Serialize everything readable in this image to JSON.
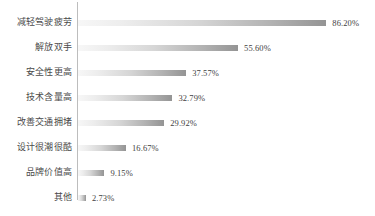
{
  "chart_data": {
    "type": "bar",
    "orientation": "horizontal",
    "title": "",
    "xlabel": "",
    "ylabel": "",
    "grid": false,
    "legend": false,
    "axis_line": true,
    "xlim": [
      0,
      100
    ],
    "value_suffix": "%",
    "categories": [
      "减轻驾驶疲劳",
      "解放双手",
      "安全性更高",
      "技术含量高",
      "改善交通拥堵",
      "设计很潮很酷",
      "品牌价值高",
      "其他"
    ],
    "values": [
      86.2,
      55.6,
      37.57,
      32.79,
      29.92,
      16.67,
      9.15,
      2.73
    ],
    "value_labels": [
      "86.20%",
      "55.60%",
      "37.57%",
      "32.79%",
      "29.92%",
      "16.67%",
      "9.15%",
      "2.73%"
    ],
    "bars": [
      {
        "category": "减轻驾驶疲劳",
        "value": 86.2,
        "label": "86.20%"
      },
      {
        "category": "解放双手",
        "value": 55.6,
        "label": "55.60%"
      },
      {
        "category": "安全性更高",
        "value": 37.57,
        "label": "37.57%"
      },
      {
        "category": "技术含量高",
        "value": 32.79,
        "label": "32.79%"
      },
      {
        "category": "改善交通拥堵",
        "value": 29.92,
        "label": "29.92%"
      },
      {
        "category": "设计很潮很酷",
        "value": 16.67,
        "label": "16.67%"
      },
      {
        "category": "品牌价值高",
        "value": 9.15,
        "label": "9.15%"
      },
      {
        "category": "其他",
        "value": 2.73,
        "label": "2.73%"
      }
    ],
    "colors": {
      "bar_gradient_start": "#f7f7f7",
      "bar_gradient_end": "#949494",
      "axis_line": "#bdbdbd",
      "category_text": "#4a4a4a",
      "value_text": "#3f3f3f",
      "background": "#ffffff"
    },
    "layout": {
      "axis_x_px": 78,
      "row_height_px": 25,
      "first_row_top_px": 10,
      "bar_height_px": 6,
      "px_per_percent": 2.88
    }
  }
}
